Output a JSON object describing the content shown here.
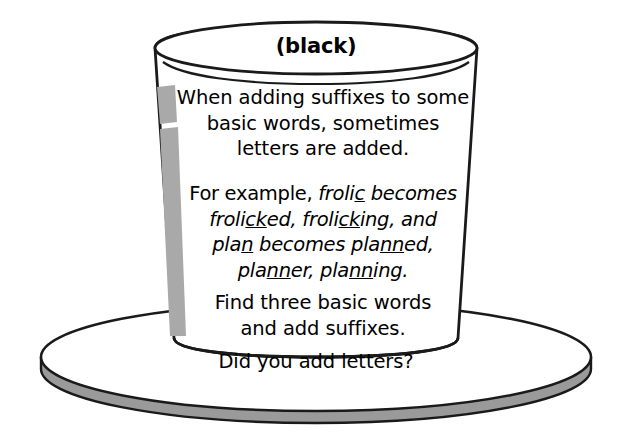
{
  "illustration": {
    "subject": "top-hat-worksheet",
    "crown_label": "(black)",
    "brim_question": "Did you add letters?",
    "colors": {
      "outline": "#1a1a1a",
      "hat_fill": "#ffffff",
      "shade_stripe": "#a9a9a9",
      "brim_shadow": "#9a9a9a",
      "text": "#000000",
      "background": "#ffffff"
    }
  },
  "paragraphs": [
    {
      "id": "intro",
      "style": "roman",
      "lines": [
        "When adding suffixes to some",
        "basic words, sometimes",
        "letters are added."
      ]
    },
    {
      "id": "example",
      "style": "italic",
      "lines": [
        "For example, frolic becomes",
        "frolicked, frolicking, and",
        "plan becomes planned,",
        "planner, planning."
      ],
      "line_segments": [
        [
          {
            "text": "For example, ",
            "italic": false,
            "underline": false
          },
          {
            "text": "froli",
            "italic": true,
            "underline": false
          },
          {
            "text": "c",
            "italic": true,
            "underline": true
          },
          {
            "text": " becomes",
            "italic": true,
            "underline": false
          }
        ],
        [
          {
            "text": "froli",
            "italic": true,
            "underline": false
          },
          {
            "text": "ck",
            "italic": true,
            "underline": true
          },
          {
            "text": "ed, froli",
            "italic": true,
            "underline": false
          },
          {
            "text": "ck",
            "italic": true,
            "underline": true
          },
          {
            "text": "ing, and",
            "italic": true,
            "underline": false
          }
        ],
        [
          {
            "text": "pla",
            "italic": true,
            "underline": false
          },
          {
            "text": "n",
            "italic": true,
            "underline": true
          },
          {
            "text": " becomes pla",
            "italic": true,
            "underline": false
          },
          {
            "text": "nn",
            "italic": true,
            "underline": true
          },
          {
            "text": "ed,",
            "italic": true,
            "underline": false
          }
        ],
        [
          {
            "text": "pla",
            "italic": true,
            "underline": false
          },
          {
            "text": "nn",
            "italic": true,
            "underline": true
          },
          {
            "text": "er, pla",
            "italic": true,
            "underline": false
          },
          {
            "text": "nn",
            "italic": true,
            "underline": true
          },
          {
            "text": "ing.",
            "italic": true,
            "underline": false
          }
        ]
      ]
    },
    {
      "id": "task",
      "style": "roman",
      "lines": [
        "Find three basic words",
        "and add suffixes."
      ]
    }
  ]
}
